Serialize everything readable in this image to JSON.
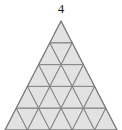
{
  "figure": {
    "label": "4",
    "shape": "equilateral-triangle",
    "subdivision_order": 5,
    "upward_cells": 15,
    "downward_cells": 10,
    "total_cells": 25,
    "fill_color": "#e2e2e2",
    "stroke_color": "#8a8a8a",
    "background_color": "#ffffff",
    "apex": {
      "x": 61,
      "y": 21
    },
    "base_left": {
      "x": 5,
      "y": 130
    },
    "base_right": {
      "x": 117,
      "y": 130
    },
    "row_heights": [
      21.8,
      21.8,
      21.8,
      21.8,
      21.8
    ],
    "bottom_row_clipped": true
  },
  "chart_data": {
    "type": "diagram",
    "title": "4",
    "rows": [
      {
        "row": 1,
        "up_triangles": 1,
        "down_triangles": 0
      },
      {
        "row": 2,
        "up_triangles": 2,
        "down_triangles": 1
      },
      {
        "row": 3,
        "up_triangles": 3,
        "down_triangles": 2
      },
      {
        "row": 4,
        "up_triangles": 4,
        "down_triangles": 3
      },
      {
        "row": 5,
        "up_triangles": 5,
        "down_triangles": 4
      }
    ]
  }
}
